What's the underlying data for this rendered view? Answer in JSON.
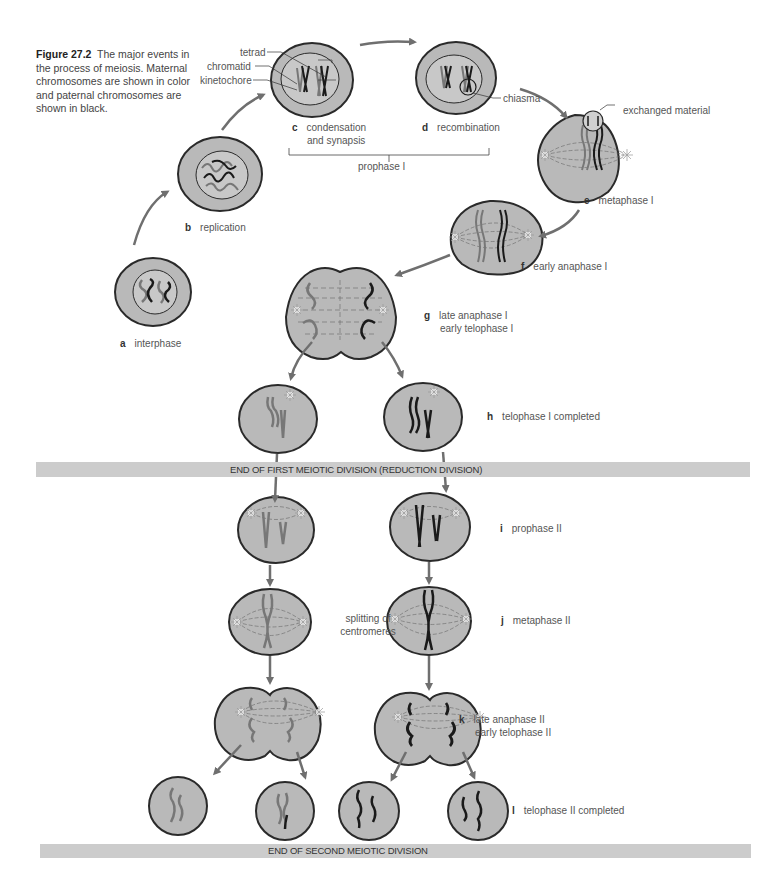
{
  "figure": {
    "number": "Figure 27.2",
    "caption": "The major events in the process of meiosis. Maternal chromosomes are shown in color and paternal chromosomes are shown in black."
  },
  "colors": {
    "cell_fill": "#b9b9b9",
    "nucleus_fill": "#d2d2d2",
    "nucleus_inner": "#bdbdbd",
    "outline": "#2a2a2a",
    "arrow": "#6f6f6f",
    "maternal": "#7a7a7a",
    "paternal": "#1a1a1a",
    "band": "#cccccc"
  },
  "callouts": {
    "tetrad": "tetrad",
    "chromatid": "chromatid",
    "kinetochore": "kinetochore",
    "chiasma": "chiasma",
    "exchanged_material": "exchanged material",
    "prophase_group": "prophase I",
    "splitting": "splitting of centromeres"
  },
  "stages": [
    {
      "letter": "a",
      "label": "interphase"
    },
    {
      "letter": "b",
      "label": "replication"
    },
    {
      "letter": "c",
      "label": "condensation",
      "label2": "and synapsis"
    },
    {
      "letter": "d",
      "label": "recombination"
    },
    {
      "letter": "e",
      "label": "metaphase I"
    },
    {
      "letter": "f",
      "label": "early anaphase I"
    },
    {
      "letter": "g",
      "label": "late anaphase I",
      "label2": "early telophase I"
    },
    {
      "letter": "h",
      "label": "telophase I completed"
    },
    {
      "letter": "i",
      "label": "prophase II"
    },
    {
      "letter": "j",
      "label": "metaphase II"
    },
    {
      "letter": "k",
      "label": "late anaphase II",
      "label2": "early telophase II"
    },
    {
      "letter": "l",
      "label": "telophase II completed"
    }
  ],
  "bands": {
    "first": "END OF FIRST MEIOTIC DIVISION (REDUCTION DIVISION)",
    "second": "END OF SECOND MEIOTIC DIVISION"
  }
}
